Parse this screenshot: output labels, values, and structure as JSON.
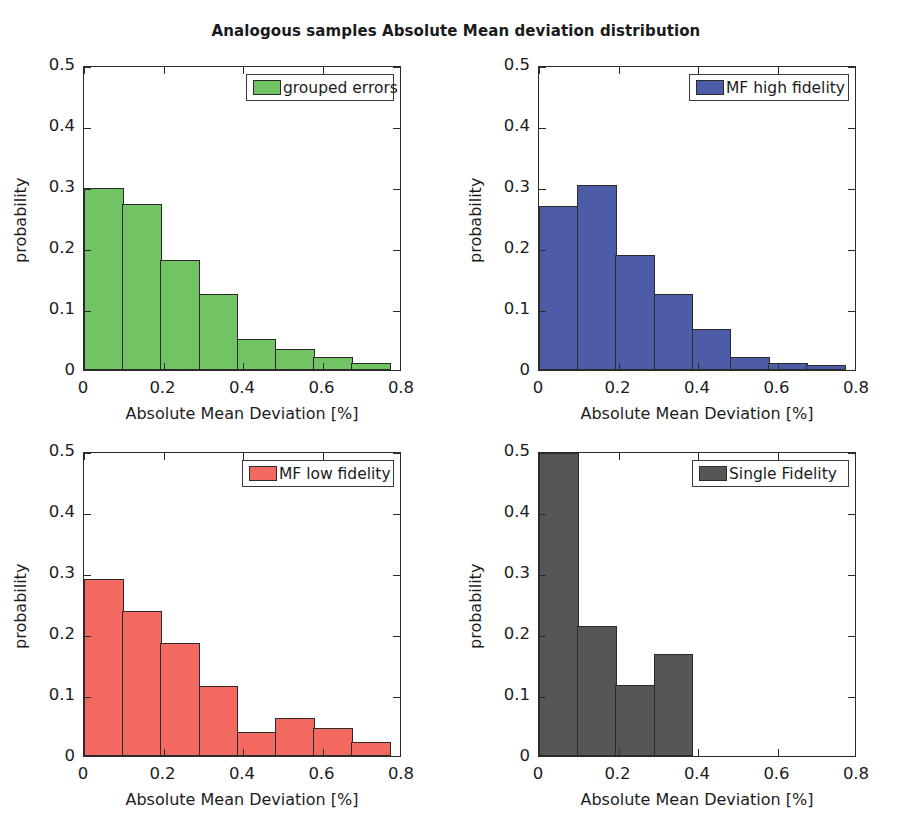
{
  "figure": {
    "title": "Analogous samples Absolute Mean deviation distribution",
    "width": 912,
    "height": 825
  },
  "chart_data": [
    {
      "type": "bar",
      "title": "Analogous samples Absolute Mean deviation distribution",
      "panel": "top-left",
      "legend_label": "grouped errors",
      "legend_position": "upper right",
      "color": "#72C364",
      "edge_color": "#2b2b2b",
      "xlabel": "Absolute Mean Deviation [%]",
      "ylabel": "probability",
      "xlim": [
        0,
        0.8
      ],
      "ylim": [
        0,
        0.5
      ],
      "xticks": [
        0,
        0.2,
        0.4,
        0.6,
        0.8
      ],
      "xticklabels": [
        "0",
        "0.2",
        "0.4",
        "0.6",
        "0.8"
      ],
      "yticks": [
        0,
        0.1,
        0.2,
        0.3,
        0.4,
        0.5
      ],
      "yticklabels": [
        "0",
        "0.1",
        "0.2",
        "0.3",
        "0.4",
        "0.5"
      ],
      "grid": false,
      "bin_edges": [
        0,
        0.1,
        0.2,
        0.3,
        0.4,
        0.5,
        0.6,
        0.7,
        0.8
      ],
      "categories": [
        "0-0.1",
        "0.1-0.2",
        "0.2-0.3",
        "0.3-0.4",
        "0.4-0.5",
        "0.5-0.6",
        "0.6-0.7",
        "0.7-0.8"
      ],
      "values": [
        0.301,
        0.274,
        0.181,
        0.126,
        0.052,
        0.034,
        0.022,
        0.012
      ]
    },
    {
      "type": "bar",
      "panel": "top-right",
      "legend_label": "MF high fidelity",
      "legend_position": "upper right",
      "color": "#4C5CA6",
      "edge_color": "#2b2b2b",
      "xlabel": "Absolute Mean Deviation [%]",
      "ylabel": "probability",
      "xlim": [
        0,
        0.8
      ],
      "ylim": [
        0,
        0.5
      ],
      "xticks": [
        0,
        0.2,
        0.4,
        0.6,
        0.8
      ],
      "xticklabels": [
        "0",
        "0.2",
        "0.4",
        "0.6",
        "0.8"
      ],
      "yticks": [
        0,
        0.1,
        0.2,
        0.3,
        0.4,
        0.5
      ],
      "yticklabels": [
        "0",
        "0.1",
        "0.2",
        "0.3",
        "0.4",
        "0.5"
      ],
      "grid": false,
      "bin_edges": [
        0,
        0.1,
        0.2,
        0.3,
        0.4,
        0.5,
        0.6,
        0.7,
        0.8
      ],
      "categories": [
        "0-0.1",
        "0.1-0.2",
        "0.2-0.3",
        "0.3-0.4",
        "0.4-0.5",
        "0.5-0.6",
        "0.6-0.7",
        "0.7-0.8"
      ],
      "values": [
        0.27,
        0.305,
        0.19,
        0.125,
        0.067,
        0.022,
        0.012,
        0.008
      ]
    },
    {
      "type": "bar",
      "panel": "bottom-left",
      "legend_label": "MF low fidelity",
      "legend_position": "upper right",
      "color": "#F4695F",
      "edge_color": "#2b2b2b",
      "xlabel": "Absolute Mean Deviation [%]",
      "ylabel": "probability",
      "xlim": [
        0,
        0.8
      ],
      "ylim": [
        0,
        0.5
      ],
      "xticks": [
        0,
        0.2,
        0.4,
        0.6,
        0.8
      ],
      "xticklabels": [
        "0",
        "0.2",
        "0.4",
        "0.6",
        "0.8"
      ],
      "yticks": [
        0,
        0.1,
        0.2,
        0.3,
        0.4,
        0.5
      ],
      "yticklabels": [
        "0",
        "0.1",
        "0.2",
        "0.3",
        "0.4",
        "0.5"
      ],
      "grid": false,
      "bin_edges": [
        0,
        0.1,
        0.2,
        0.3,
        0.4,
        0.5,
        0.6,
        0.7,
        0.8
      ],
      "categories": [
        "0-0.1",
        "0.1-0.2",
        "0.2-0.3",
        "0.3-0.4",
        "0.4-0.5",
        "0.5-0.6",
        "0.6-0.7",
        "0.7-0.8"
      ],
      "values": [
        0.292,
        0.239,
        0.187,
        0.116,
        0.039,
        0.062,
        0.047,
        0.023
      ]
    },
    {
      "type": "bar",
      "panel": "bottom-right",
      "legend_label": "Single Fidelity",
      "legend_position": "upper right",
      "color": "#565656",
      "edge_color": "#2b2b2b",
      "xlabel": "Absolute Mean Deviation [%]",
      "ylabel": "probability",
      "xlim": [
        0,
        0.8
      ],
      "ylim": [
        0,
        0.5
      ],
      "xticks": [
        0,
        0.2,
        0.4,
        0.6,
        0.8
      ],
      "xticklabels": [
        "0",
        "0.2",
        "0.4",
        "0.6",
        "0.8"
      ],
      "yticks": [
        0,
        0.1,
        0.2,
        0.3,
        0.4,
        0.5
      ],
      "yticklabels": [
        "0",
        "0.1",
        "0.2",
        "0.3",
        "0.4",
        "0.5"
      ],
      "grid": false,
      "bin_edges": [
        0,
        0.1,
        0.2,
        0.3,
        0.4,
        0.5,
        0.6,
        0.7,
        0.8
      ],
      "categories": [
        "0-0.1",
        "0.1-0.2",
        "0.2-0.3",
        "0.3-0.4",
        "0.4-0.5",
        "0.5-0.6",
        "0.6-0.7",
        "0.7-0.8"
      ],
      "values": [
        0.5,
        0.215,
        0.117,
        0.168,
        0.0,
        0.0,
        0.0,
        0.0
      ]
    }
  ]
}
